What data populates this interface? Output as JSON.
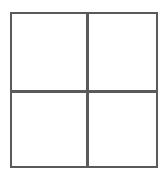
{
  "diagram": {
    "type": "2x2 grid",
    "rows": 2,
    "columns": 2,
    "line_color": "#5a5a5a",
    "background": "#ffffff",
    "cells": [
      {
        "row": 1,
        "col": 1,
        "label": ""
      },
      {
        "row": 1,
        "col": 2,
        "label": ""
      },
      {
        "row": 2,
        "col": 1,
        "label": ""
      },
      {
        "row": 2,
        "col": 2,
        "label": ""
      }
    ]
  }
}
